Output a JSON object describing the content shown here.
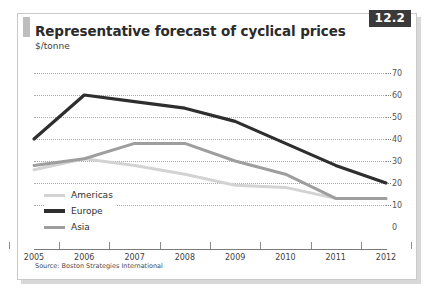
{
  "figure": {
    "badge": "12.2",
    "title": "Representative forecast of cyclical prices",
    "subtitle": "$/tonne",
    "source": "Source: Boston Strategies International"
  },
  "colors": {
    "americas": "#d3d3d3",
    "europe": "#2e2e2e",
    "asia": "#9e9e9e",
    "gridline": "#a9a9a9",
    "axis": "#7a7a7a",
    "badge_bg": "#3a3a3a",
    "card_border": "#c8c8c8"
  },
  "chart_data": {
    "type": "line",
    "title": "Representative forecast of cyclical prices",
    "subtitle": "$/tonne",
    "xlabel": "",
    "ylabel": "$/tonne",
    "categories": [
      "2005",
      "2006",
      "2007",
      "2008",
      "2009",
      "2010",
      "2011",
      "2012"
    ],
    "ylim": [
      0,
      70
    ],
    "yticks": [
      0,
      10,
      20,
      30,
      40,
      50,
      60,
      70
    ],
    "y_axis_position": "right",
    "grid": "horizontal-dotted",
    "legend_position": "inside-bottom-left",
    "series": [
      {
        "name": "Americas",
        "color": "#d3d3d3",
        "width": 3.0,
        "values": [
          26,
          31,
          28,
          24,
          19,
          18,
          13,
          13
        ]
      },
      {
        "name": "Europe",
        "color": "#2e2e2e",
        "width": 3.2,
        "values": [
          40,
          60,
          57,
          54,
          48,
          38,
          28,
          20
        ]
      },
      {
        "name": "Asia",
        "color": "#9e9e9e",
        "width": 3.0,
        "values": [
          28,
          31,
          38,
          38,
          30,
          24,
          13,
          13
        ]
      }
    ]
  }
}
